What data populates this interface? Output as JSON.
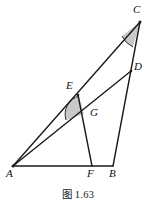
{
  "figure": {
    "caption": "图 1.63",
    "background_color": "#ffffff",
    "stroke_color": "#1a1a1a",
    "shade_color": "#c9c9c9",
    "label_color": "#101010"
  },
  "labels": {
    "A": "A",
    "B": "B",
    "C": "C",
    "D": "D",
    "E": "E",
    "F": "F",
    "G": "G"
  },
  "points": {
    "A": {
      "x": 13,
      "y": 166
    },
    "B": {
      "x": 113,
      "y": 166
    },
    "C": {
      "x": 140,
      "y": 22
    },
    "D": {
      "x": 131,
      "y": 71
    },
    "E": {
      "x": 78,
      "y": 95
    },
    "F": {
      "x": 92,
      "y": 166
    },
    "G": {
      "x": 84,
      "y": 114
    }
  },
  "label_positions": {
    "A": {
      "x": 6,
      "y": 170
    },
    "B": {
      "x": 110,
      "y": 170
    },
    "C": {
      "x": 134,
      "y": 6
    },
    "D": {
      "x": 134,
      "y": 63
    },
    "E": {
      "x": 67,
      "y": 82
    },
    "F": {
      "x": 88,
      "y": 170
    },
    "G": {
      "x": 90,
      "y": 110
    }
  },
  "segments": [
    {
      "name": "segment-AB",
      "from": "A",
      "to": "B"
    },
    {
      "name": "segment-AC",
      "from": "A",
      "to": "C"
    },
    {
      "name": "segment-CB",
      "from": "C",
      "to": "B"
    },
    {
      "name": "segment-AD",
      "from": "A",
      "to": "D"
    },
    {
      "name": "segment-EF",
      "from": "E",
      "to": "F"
    }
  ],
  "angle_marks": [
    {
      "name": "angle-mark-C",
      "vertex": "C",
      "shaded": true
    },
    {
      "name": "angle-mark-G",
      "vertex": "G",
      "shaded": true
    }
  ]
}
